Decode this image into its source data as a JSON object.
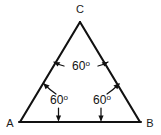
{
  "figure": {
    "type": "geometry-diagram",
    "shape": "equilateral-triangle",
    "background_color": "#ffffff",
    "line_color": "#111111",
    "text_color": "#121212"
  },
  "vertices": {
    "apex": {
      "name": "C",
      "label": "C",
      "x": 80,
      "y": 22
    },
    "bottom_left": {
      "name": "A",
      "label": "A",
      "x": 20,
      "y": 122
    },
    "bottom_right": {
      "name": "B",
      "label": "B",
      "x": 140,
      "y": 122
    }
  },
  "vertex_labels": {
    "apex": "C",
    "bottom_left": "A",
    "bottom_right": "B"
  },
  "angles": [
    {
      "at_vertex": "C",
      "value": "60",
      "degree_symbol": "o",
      "label": "60o",
      "label_x": 80,
      "label_y": 70,
      "leaders": 2
    },
    {
      "at_vertex": "A",
      "value": "60",
      "degree_symbol": "o",
      "label": "60o",
      "label_x": 58,
      "label_y": 104,
      "leaders": 2
    },
    {
      "at_vertex": "B",
      "value": "60",
      "degree_symbol": "o",
      "label": "60o",
      "label_x": 104,
      "label_y": 104,
      "leaders": 2
    }
  ]
}
